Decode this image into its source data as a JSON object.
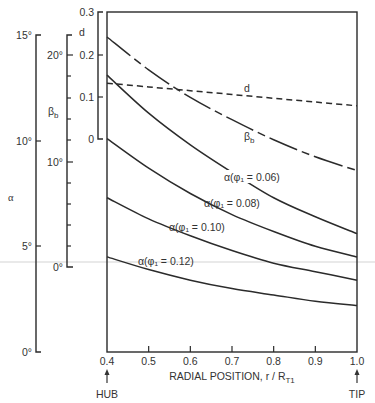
{
  "chart_data": {
    "type": "line",
    "title": "",
    "xlabel": "RADIAL POSITION, r / R_T1",
    "x_ticks": [
      "0.4",
      "0.5",
      "0.6",
      "0.7",
      "0.8",
      "0.9",
      "1.0"
    ],
    "xlim": [
      0.4,
      1.0
    ],
    "x_annotations": {
      "hub": "HUB",
      "tip": "TIP"
    },
    "axes": {
      "alpha": {
        "label": "α",
        "ticks": [
          "0°",
          "5°",
          "10°",
          "15°"
        ],
        "range": [
          0,
          15
        ]
      },
      "beta_b": {
        "label": "β",
        "label_sub": "b",
        "ticks": [
          "0°",
          "10°",
          "20°"
        ],
        "range": [
          0,
          20
        ]
      },
      "d": {
        "label": "d",
        "ticks": [
          "0",
          "0.1",
          "0.2",
          "0.3"
        ],
        "range": [
          0,
          0.3
        ]
      }
    },
    "grid": false,
    "x": [
      0.4,
      0.5,
      0.6,
      0.7,
      0.8,
      0.9,
      1.0
    ],
    "series": [
      {
        "name": "d",
        "axis": "d",
        "style": "dashed",
        "values": [
          0.133,
          0.124,
          0.115,
          0.106,
          0.097,
          0.088,
          0.079
        ]
      },
      {
        "name": "β_b",
        "axis": "beta_b",
        "style": "dash-dot",
        "values": [
          21.7,
          18.6,
          16.0,
          13.9,
          12.0,
          10.4,
          9.1
        ]
      },
      {
        "name": "α(φ1 = 0.06)",
        "axis": "alpha",
        "style": "solid",
        "values": [
          13.1,
          11.3,
          9.8,
          8.5,
          7.3,
          6.4,
          5.6
        ]
      },
      {
        "name": "α(φ1 = 0.08)",
        "axis": "alpha",
        "style": "solid",
        "values": [
          10.1,
          8.7,
          7.5,
          6.5,
          5.7,
          5.0,
          4.5
        ]
      },
      {
        "name": "α(φ1 = 0.10)",
        "axis": "alpha",
        "style": "solid",
        "values": [
          7.3,
          6.3,
          5.5,
          4.8,
          4.2,
          3.8,
          3.4
        ]
      },
      {
        "name": "α(φ1 = 0.12)",
        "axis": "alpha",
        "style": "solid",
        "values": [
          4.5,
          3.9,
          3.4,
          3.0,
          2.7,
          2.4,
          2.2
        ]
      }
    ],
    "curve_labels": [
      {
        "text": "d",
        "series": 0
      },
      {
        "text": "β",
        "sub": "b",
        "series": 1
      },
      {
        "text": "α(φ₁ = 0.06)",
        "series": 2
      },
      {
        "text": "α(φ₁ = 0.08)",
        "series": 3
      },
      {
        "text": "α(φ₁ = 0.10)",
        "series": 4
      },
      {
        "text": "α(φ₁ = 0.12)",
        "series": 5
      }
    ]
  }
}
